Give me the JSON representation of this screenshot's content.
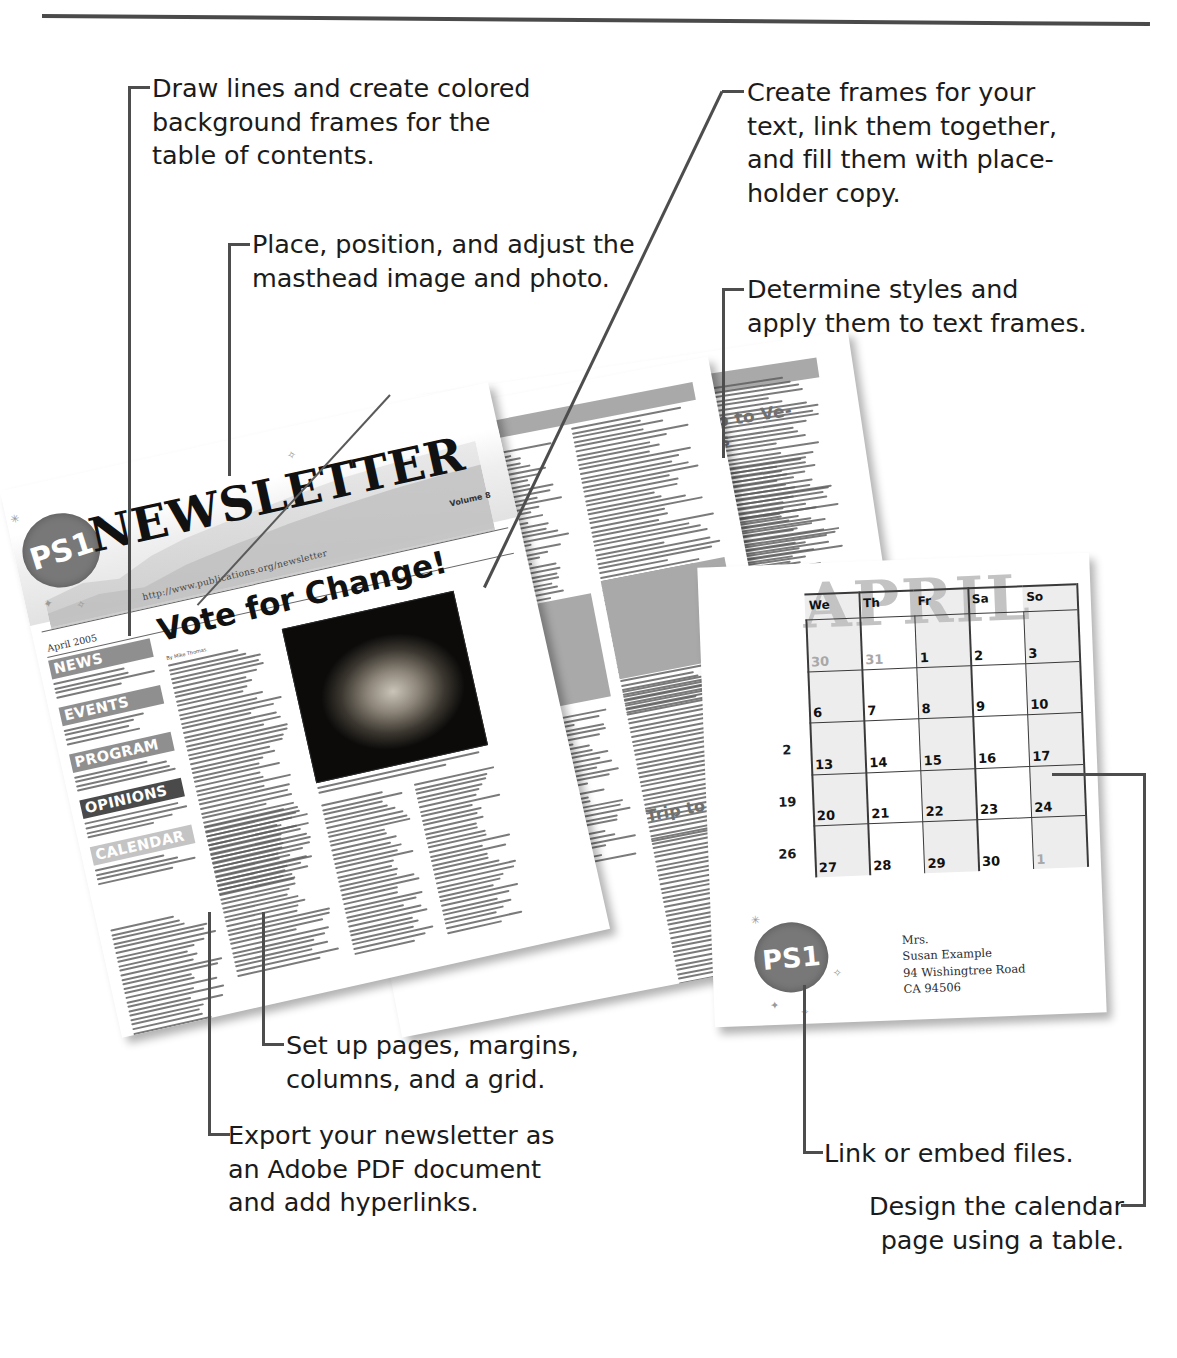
{
  "figure": {
    "type": "annotated-illustration"
  },
  "callouts": [
    {
      "id": "draw-lines",
      "text": "Draw lines and create colored\nbackground frames for the\ntable of contents."
    },
    {
      "id": "place-image",
      "text": "Place, position, and adjust the\nmasthead image and photo."
    },
    {
      "id": "create-frames",
      "text": "Create frames for your\ntext, link them together,\nand fill them with place-\nholder copy."
    },
    {
      "id": "determine-styles",
      "text": "Determine styles and\napply them to text frames."
    },
    {
      "id": "set-up-pages",
      "text": "Set up pages, margins,\ncolumns, and a grid."
    },
    {
      "id": "export-pdf",
      "text": "Export your newsletter as\nan Adobe PDF document\nand add hyperlinks."
    },
    {
      "id": "link-embed",
      "text": "Link or embed files."
    },
    {
      "id": "design-calendar",
      "text": "Design the calendar\npage using a table."
    }
  ],
  "newsletter": {
    "stamp": "PS1",
    "title": "NEWSLETTER",
    "url": "http://www.publications.org/newsletter",
    "volume": "Volume 8",
    "date": "April 2005",
    "headline": "Vote for Change!",
    "byline": "By Mike Thomas",
    "caption": "Ut wisi enim ad minim veniam quis nostrud exerci tation ullamcorper suscipit lobortis.",
    "sections": [
      {
        "label": "NEWS",
        "style": "mid"
      },
      {
        "label": "EVENTS",
        "style": "mid"
      },
      {
        "label": "PROGRAM",
        "style": "mid"
      },
      {
        "label": "OPINIONS",
        "style": "dark"
      },
      {
        "label": "CALENDAR",
        "style": "light"
      }
    ]
  },
  "page_news": {
    "section_head": "NEWS",
    "article_title": "Trip to Venus"
  },
  "page_events": {
    "section_head": "EVENTS",
    "article_title_1": "Trip to Ve-\nnus",
    "article_title_2": "Trip to Pluto",
    "dropcap": "A"
  },
  "calendar": {
    "watermark": "APRIL",
    "day_headers": [
      "We",
      "Th",
      "Fr",
      "Sa",
      "So"
    ],
    "weeks": [
      [
        {
          "n": "30",
          "dim": true
        },
        {
          "n": "31",
          "dim": true
        },
        {
          "n": "1"
        },
        {
          "n": "2"
        },
        {
          "n": "3"
        }
      ],
      [
        {
          "n": "6"
        },
        {
          "n": "7"
        },
        {
          "n": "8"
        },
        {
          "n": "9"
        },
        {
          "n": "10"
        }
      ],
      [
        {
          "n": "13"
        },
        {
          "n": "14"
        },
        {
          "n": "15"
        },
        {
          "n": "16"
        },
        {
          "n": "17"
        }
      ],
      [
        {
          "n": "20"
        },
        {
          "n": "21"
        },
        {
          "n": "22"
        },
        {
          "n": "23"
        },
        {
          "n": "24"
        }
      ],
      [
        {
          "n": "27"
        },
        {
          "n": "28"
        },
        {
          "n": "29"
        },
        {
          "n": "30"
        },
        {
          "n": "1",
          "dim": true
        }
      ]
    ],
    "edge_numbers": [
      "2",
      "19",
      "26"
    ],
    "stamp": "PS1",
    "address": "Mrs.\nSusan Example\n94 Wishingtree Road\nCA 94506"
  },
  "colors": {
    "ink": "#1b1b1b",
    "leader": "#4d4d4d",
    "rule": "#4a4a4a",
    "stamp_gray": "#787878",
    "band_gray": "#8f8f8f",
    "placeholder_gray": "#a9a9a9",
    "watermark_gray": "#c3c3c3",
    "paper": "#ffffff"
  }
}
